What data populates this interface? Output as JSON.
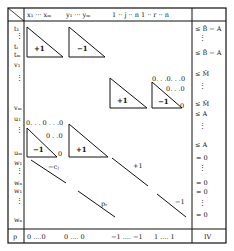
{
  "header": {
    "columns": [
      {
        "label": "x₁ ··· xₘ"
      },
      {
        "label": "y₁ ··· yₘ"
      },
      {
        "label": "1 ·· j ·· n  1 ·· r ·· n"
      }
    ]
  },
  "row_labels": {
    "t_top": "t₁",
    "t_mid": "tᵢ",
    "t_m": "tₘ",
    "v_top": "v₁",
    "v_bot": "vₘ",
    "u_top": "u₁",
    "u_bot": "uₘ",
    "w_top": "w₁",
    "w_bot": "wₙ",
    "z_top": "w₁",
    "z_bot": "wₙ",
    "p": "p"
  },
  "blocks": {
    "t_x": "+1",
    "t_y": "−1",
    "v_y": "+1",
    "v_z": "−1",
    "u_x": "−1",
    "u_y": "+1",
    "w_diag1": "−cⱼ",
    "w_diag2": "+1",
    "z_diag1": "pᵣ",
    "z_diag2": "−1",
    "zero_pattern_row1": "0 ·· 0 ·· 0",
    "zero_pattern_row2": "0 ·· 0",
    "zero_single": "0"
  },
  "rhs": {
    "r1": "≤ B̄ − A",
    "r2": "≤ B̄ − A",
    "r3": "≤ M̄",
    "r4": "≤ M̄",
    "r5": "≤ A",
    "r6": "≤ A",
    "r7": "= 0",
    "r8": "= 0",
    "r9": "= 0",
    "r10": "= 0",
    "footer": "IV"
  },
  "footer_row": {
    "seg1": "0 ....0",
    "seg2": "0 ....  0",
    "seg3": "−1 .... −1",
    "seg4": "1 .... 1"
  }
}
